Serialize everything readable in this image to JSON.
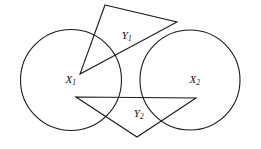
{
  "figure": {
    "background_color": "#ffffff",
    "stroke_color": "#1a1a1a",
    "text_color": "#101010",
    "width": 261,
    "height": 149,
    "circles": [
      {
        "id": "circle-x1",
        "label_base": "X",
        "label_sub": "1",
        "cx": 71,
        "cy": 80,
        "r": 50.5,
        "label_x": 68,
        "label_y": 80
      },
      {
        "id": "circle-x2",
        "label_base": "X",
        "label_sub": "2",
        "cx": 190,
        "cy": 80,
        "r": 50,
        "label_x": 192,
        "label_y": 80
      }
    ],
    "triangles": [
      {
        "id": "triangle-y1",
        "label_base": "Y",
        "label_sub": "1",
        "points": "105,5 177,22 80,74",
        "label_x": 124,
        "label_y": 36
      },
      {
        "id": "triangle-y2",
        "label_base": "Y",
        "label_sub": "2",
        "points": "76,97 196,98 137,137",
        "label_x": 136,
        "label_y": 114
      }
    ]
  }
}
